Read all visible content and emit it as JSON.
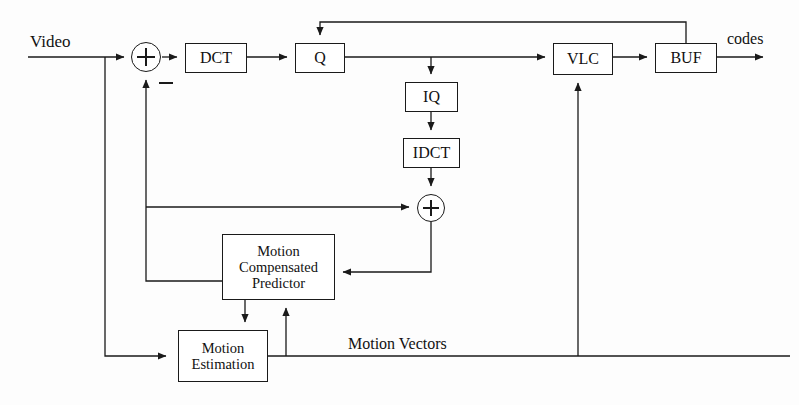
{
  "diagram": {
    "background_color": "#fdfdfd",
    "line_color": "#1a1a1a",
    "blocks": [
      {
        "id": "dct",
        "label": "DCT",
        "x": 185,
        "y": 43,
        "w": 62,
        "h": 30
      },
      {
        "id": "q",
        "label": "Q",
        "x": 295,
        "y": 43,
        "w": 50,
        "h": 30
      },
      {
        "id": "vlc",
        "label": "VLC",
        "x": 553,
        "y": 43,
        "w": 60,
        "h": 32
      },
      {
        "id": "buf",
        "label": "BUF",
        "x": 655,
        "y": 43,
        "w": 62,
        "h": 30
      },
      {
        "id": "iq",
        "label": "IQ",
        "x": 405,
        "y": 82,
        "w": 53,
        "h": 30
      },
      {
        "id": "idct",
        "label": "IDCT",
        "x": 403,
        "y": 138,
        "w": 57,
        "h": 30
      },
      {
        "id": "mcp",
        "label": "Motion Compensated Predictor",
        "label_lines": [
          "Motion",
          "Compensated",
          "Predictor"
        ],
        "x": 222,
        "y": 234,
        "w": 113,
        "h": 66
      },
      {
        "id": "me",
        "label": "Motion Estimation",
        "label_lines": [
          "Motion",
          "Estimation"
        ],
        "x": 178,
        "y": 330,
        "w": 90,
        "h": 52
      }
    ],
    "adders": [
      {
        "id": "subtract-adder",
        "cx": 146,
        "cy": 57,
        "r": 15,
        "sign": "minus"
      },
      {
        "id": "sum-adder",
        "cx": 431,
        "cy": 208,
        "r": 14,
        "sign": "plus"
      }
    ],
    "labels": [
      {
        "id": "video-label",
        "text": "Video",
        "x": 30,
        "y": 32
      },
      {
        "id": "codes-label",
        "text": "codes",
        "x": 727,
        "y": 32
      },
      {
        "id": "motion-vectors-label",
        "text": "Motion Vectors",
        "x": 348,
        "y": 336
      },
      {
        "id": "minus-sign-label",
        "text": "−",
        "x": 160,
        "y": 74
      }
    ],
    "signal_flow": [
      "Video input -> subtract adder -> DCT -> Q -> VLC -> BUF -> codes",
      "BUF rate-control feedback -> Q",
      "Q -> IQ -> IDCT -> sum adder",
      "Motion Compensated Predictor -> subtract adder (minus) and -> sum adder",
      "sum adder -> Motion Compensated Predictor",
      "Video input -> Motion Estimation -> Motion Compensated Predictor",
      "Motion Vectors -> VLC"
    ]
  }
}
